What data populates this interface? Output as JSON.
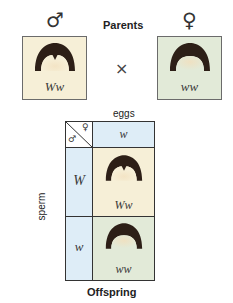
{
  "header": {
    "male_symbol": "♂",
    "female_symbol": "♀",
    "title": "Parents",
    "cross_symbol": "×"
  },
  "parents": [
    {
      "genotype": "Ww",
      "bg_color": "#f6efd7",
      "sex": "male"
    },
    {
      "genotype": "ww",
      "bg_color": "#e2ead8",
      "sex": "female"
    }
  ],
  "punnett": {
    "top_label": "eggs",
    "side_label": "sperm",
    "corner_male": "♂",
    "corner_female": "♀",
    "egg_alleles": [
      "w"
    ],
    "sperm_alleles": [
      "W",
      "w"
    ],
    "offspring": [
      {
        "genotype": "Ww",
        "bg_color": "#f6efd7"
      },
      {
        "genotype": "ww",
        "bg_color": "#e2ead8"
      }
    ],
    "header_bg_color": "#deedf7"
  },
  "footer": {
    "title": "Offspring"
  }
}
